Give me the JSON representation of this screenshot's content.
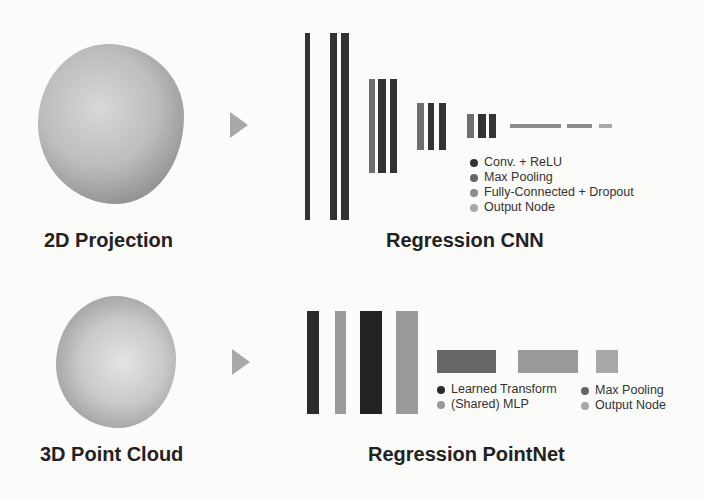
{
  "top_row": {
    "input_label": "2D Projection",
    "model_label": "Regression CNN",
    "legend": [
      {
        "label": "Conv. + ReLU",
        "color": "#333333"
      },
      {
        "label": "Max Pooling",
        "color": "#666666"
      },
      {
        "label": "Fully-Connected + Dropout",
        "color": "#8c8c8c"
      },
      {
        "label": "Output Node",
        "color": "#a8a8a8"
      }
    ]
  },
  "bottom_row": {
    "input_label": "3D Point Cloud",
    "model_label": "Regression PointNet",
    "legend_left": [
      {
        "label": "Learned Transform",
        "color": "#2b2b2b"
      },
      {
        "label": "(Shared) MLP",
        "color": "#999999"
      }
    ],
    "legend_right": [
      {
        "label": "Max Pooling",
        "color": "#666666"
      },
      {
        "label": "Output Node",
        "color": "#a8a8a8"
      }
    ]
  },
  "colors": {
    "conv": "#333333",
    "pool": "#6e6e6e",
    "fc": "#8c8c8c",
    "output": "#a8a8a8",
    "transform": "#2b2b2b",
    "mlp": "#999999",
    "arrow": "#a8a8a8"
  }
}
